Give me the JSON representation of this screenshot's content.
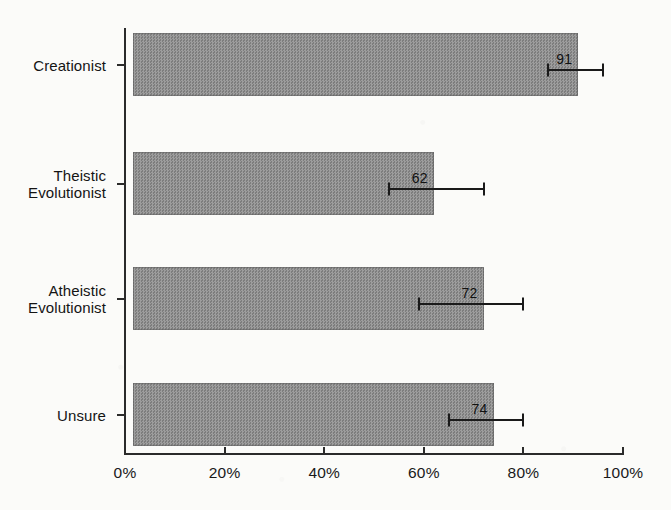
{
  "chart_data": {
    "type": "bar",
    "orientation": "horizontal",
    "title": "",
    "subtitle": "",
    "xlabel": "",
    "ylabel": "",
    "categories": [
      "Creationist",
      "Theistic\nEvolutionist",
      "Atheistic\nEvolutionist",
      "Unsure"
    ],
    "values": [
      91,
      62,
      72,
      74
    ],
    "value_labels": [
      "91",
      "62",
      "72",
      "74"
    ],
    "error_bars": [
      {
        "low": 85,
        "high": 96
      },
      {
        "low": 53,
        "high": 72
      },
      {
        "low": 59,
        "high": 80
      },
      {
        "low": 65,
        "high": 80
      }
    ],
    "xlim": [
      0,
      100
    ],
    "xticks": [
      0,
      20,
      40,
      60,
      80,
      100
    ],
    "xtick_labels": [
      "0%",
      "20%",
      "40%",
      "60%",
      "80%",
      "100%"
    ],
    "grid": false,
    "legend": null,
    "bar_color": "#8e8e8e",
    "axis_color": "#2b2b2b",
    "background_color": "#fbfbf9"
  },
  "axis": {
    "x_ticks": [
      {
        "label": "0%",
        "value": 0
      },
      {
        "label": "20%",
        "value": 20
      },
      {
        "label": "40%",
        "value": 40
      },
      {
        "label": "60%",
        "value": 60
      },
      {
        "label": "80%",
        "value": 80
      },
      {
        "label": "100%",
        "value": 100
      }
    ]
  },
  "series": [
    {
      "category": "Creationist",
      "value": 91,
      "label": "91",
      "err_low": 85,
      "err_high": 96
    },
    {
      "category": "Theistic\nEvolutionist",
      "value": 62,
      "label": "62",
      "err_low": 53,
      "err_high": 72
    },
    {
      "category": "Atheistic\nEvolutionist",
      "value": 72,
      "label": "72",
      "err_low": 59,
      "err_high": 80
    },
    {
      "category": "Unsure",
      "value": 74,
      "label": "74",
      "err_low": 65,
      "err_high": 80
    }
  ]
}
